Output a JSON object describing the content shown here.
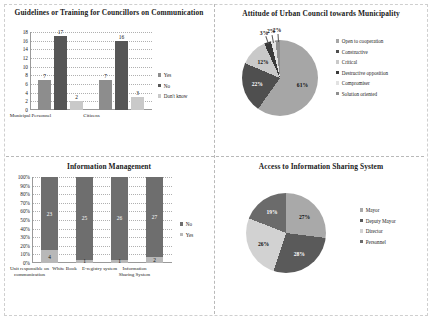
{
  "panels": {
    "top_left": {
      "title": "Guidelines or Training for Councillors on Communication"
    },
    "top_right": {
      "title": "Attitude of Urban Council towards Municipality"
    },
    "bottom_left": {
      "title": "Information Management"
    },
    "bottom_right": {
      "title": "Access to Information Sharing System"
    }
  },
  "chart_data": [
    {
      "id": "guidelines-training",
      "type": "bar",
      "title": "Guidelines or Training for Councillors on Communication",
      "xlabel": "",
      "ylabel": "",
      "ylim": [
        0,
        18
      ],
      "yticks": [
        0,
        2,
        4,
        6,
        8,
        10,
        12,
        14,
        16,
        18
      ],
      "grid": true,
      "legend_position": "right",
      "categories": [
        "Municipal Personnel",
        "Citizens"
      ],
      "series": [
        {
          "name": "Yes",
          "values": [
            7,
            7
          ],
          "color": "#8d8d8d"
        },
        {
          "name": "No",
          "values": [
            17,
            16
          ],
          "color": "#565656"
        },
        {
          "name": "Don't know",
          "values": [
            2,
            3
          ],
          "color": "#c9c9c9"
        }
      ]
    },
    {
      "id": "attitude-urban-council",
      "type": "pie",
      "title": "Attitude of Urban Council towards Municipality",
      "legend_position": "right",
      "labels": [
        "Open to cooperation",
        "Constructive",
        "Critical",
        "Destructive opposition",
        "Compromiser",
        "Solution oriented"
      ],
      "values": [
        61,
        22,
        12,
        3,
        2,
        2
      ],
      "value_labels": [
        "61%",
        "22%",
        "12%",
        "3%",
        "2%",
        "2%"
      ],
      "colors": [
        "#a6a6a6",
        "#4f4f4f",
        "#c9c9c9",
        "#3a3a3a",
        "#e2e2e2",
        "#8f8f8f"
      ]
    },
    {
      "id": "information-management",
      "type": "bar",
      "subtype": "stacked-100",
      "title": "Information Management",
      "xlabel": "",
      "ylabel": "",
      "ylim": [
        0,
        100
      ],
      "yticks": [
        "0%",
        "10%",
        "20%",
        "30%",
        "40%",
        "50%",
        "60%",
        "70%",
        "80%",
        "90%",
        "100%"
      ],
      "grid": true,
      "legend_position": "right",
      "categories": [
        "Unit responsible on communication",
        "White Book",
        "E-registry system",
        "Information Sharing System"
      ],
      "series": [
        {
          "name": "No",
          "values": [
            23,
            25,
            26,
            27
          ],
          "color": "#6e6e6e"
        },
        {
          "name": "Yes",
          "values": [
            4,
            1,
            1,
            2
          ],
          "color": "#b8b8b8"
        }
      ],
      "bar_labels": {
        "no": [
          "23",
          "25",
          "26",
          "27"
        ],
        "yes": [
          "4",
          "1",
          "1",
          "2"
        ]
      }
    },
    {
      "id": "access-information-sharing",
      "type": "pie",
      "title": "Access to Information Sharing System",
      "legend_position": "right",
      "labels": [
        "Mayor",
        "Deputy Mayor",
        "Director",
        "Personnel"
      ],
      "values": [
        27,
        28,
        26,
        19
      ],
      "value_labels": [
        "27%",
        "28%",
        "26%",
        "19%"
      ],
      "colors": [
        "#a9a9a9",
        "#5a5a5a",
        "#d2d2d2",
        "#6b6b6b"
      ]
    }
  ]
}
